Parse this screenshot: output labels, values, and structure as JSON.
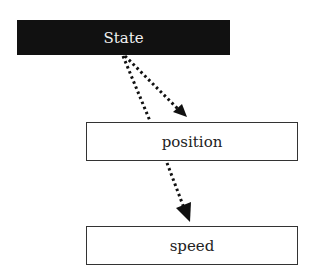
{
  "diagram": {
    "type": "flow",
    "nodes": [
      {
        "id": "state",
        "label": "State",
        "style": "filled-dark",
        "fill": "#111111",
        "text_color": "#f2f2f2"
      },
      {
        "id": "position",
        "label": "position",
        "style": "outlined",
        "fill": "#ffffff",
        "text_color": "#222222"
      },
      {
        "id": "speed",
        "label": "speed",
        "style": "outlined",
        "fill": "#ffffff",
        "text_color": "#222222"
      }
    ],
    "edges": [
      {
        "from": "state",
        "to": "position",
        "style": "dotted",
        "arrow": "filled-triangle"
      },
      {
        "from": "state",
        "to": "speed",
        "style": "dotted",
        "arrow": "filled-triangle"
      }
    ]
  }
}
